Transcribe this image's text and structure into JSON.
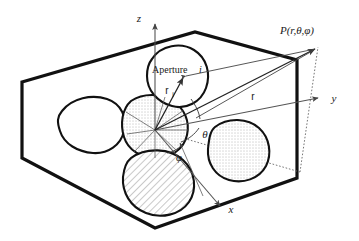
{
  "figure": {
    "kind": "spherical-coordinate-aperture-diagram",
    "background_color": "#ffffff",
    "line_color": "#111111"
  },
  "labels": {
    "axis_z": "z",
    "axis_y": "y",
    "axis_x": "x",
    "point_p": "P(r,θ,φ)",
    "aperture_text": "Aperture",
    "aperture_index": "i",
    "vector_r": "r",
    "vector_ri_base": "r",
    "vector_ri_sub": "i",
    "angle_theta": "θ",
    "angle_phi": "φ"
  },
  "geometry": {
    "origin": {
      "x": 155,
      "y": 130
    },
    "point_p": {
      "x": 318,
      "y": 47
    },
    "hexagon_vertices": "22,82 195,32 297,60 297,178 155,228 22,158",
    "z_axis": {
      "x1": 155,
      "y1": 130,
      "x2": 155,
      "y2": 22
    },
    "y_axis": {
      "x1": 155,
      "y1": 130,
      "x2": 322,
      "y2": 98
    },
    "x_axis": {
      "x1": 155,
      "y1": 130,
      "x2": 222,
      "y2": 208
    }
  },
  "shapes": {
    "aperture_i_fill": "white",
    "center_blob_fill": "stipple",
    "right_blob_fill": "stipple",
    "bottom_blob_fill": "hatch",
    "left_blob_fill": "white"
  }
}
